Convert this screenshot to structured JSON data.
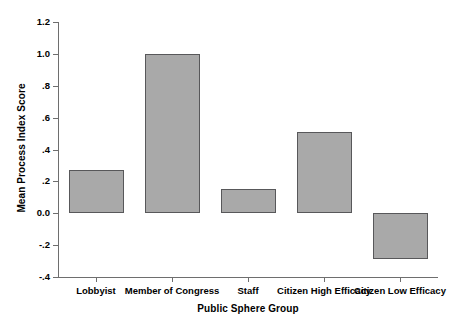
{
  "chart_data": {
    "type": "bar",
    "title": "",
    "xlabel": "Public Sphere Group",
    "ylabel": "Mean Process Index Score",
    "categories": [
      "Lobbyist",
      "Member of Congress",
      "Staff",
      "Citizen High Efficacy",
      "Citizen Low Efficacy"
    ],
    "values": [
      0.27,
      1.0,
      0.15,
      0.51,
      -0.29
    ],
    "ylim": [
      -0.4,
      1.2
    ],
    "ytick_values": [
      1.2,
      1.0,
      0.8,
      0.6,
      0.4,
      0.2,
      0.0,
      -0.2,
      -0.4
    ],
    "ytick_labels": [
      "1.2",
      "1.0",
      ".8",
      ".6",
      ".4",
      ".2",
      "0.0",
      "-.2",
      "-.4"
    ],
    "grid": false,
    "legend": null,
    "bar_color": "#a9a9a9",
    "bar_border_color": "#58585a",
    "axis_color": "#6e6e6e",
    "background": "#ffffff"
  }
}
